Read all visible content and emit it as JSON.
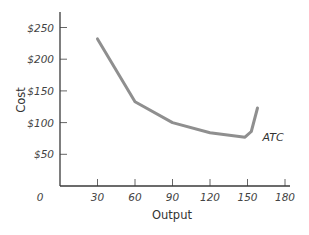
{
  "chart_data": {
    "type": "line",
    "title": "",
    "xlabel": "Output",
    "ylabel": "Cost",
    "xlim": [
      0,
      180
    ],
    "ylim": [
      0,
      275
    ],
    "x_ticks": [
      0,
      30,
      60,
      90,
      120,
      150,
      180
    ],
    "x_tick_labels": [
      "0",
      "30",
      "60",
      "90",
      "120",
      "150",
      "180"
    ],
    "y_ticks": [
      50,
      100,
      150,
      200,
      250
    ],
    "y_tick_labels": [
      "$50",
      "$100",
      "$150",
      "$200",
      "$250"
    ],
    "grid": false,
    "legend": "none",
    "series": [
      {
        "name": "ATC",
        "color": "#8f8f8f",
        "x": [
          30,
          60,
          90,
          120,
          148,
          153,
          158
        ],
        "y": [
          232,
          133,
          100,
          84,
          77,
          86,
          123
        ]
      }
    ],
    "annotations": [
      {
        "text": "ATC",
        "x": 162,
        "y": 78
      }
    ]
  },
  "colors": {
    "axis": "#3a3a3a",
    "line": "#8f8f8f",
    "text": "#444444"
  }
}
